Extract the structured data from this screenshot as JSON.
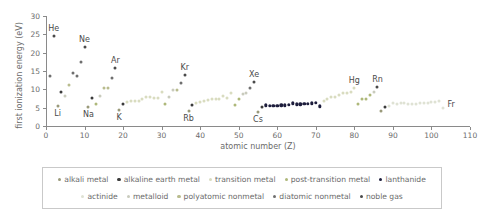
{
  "chart_data": {
    "type": "scatter",
    "title": "",
    "xlabel": "atomic number (Z)",
    "ylabel": "first ionization energy (eV)",
    "xlim": [
      0,
      110
    ],
    "ylim": [
      0,
      30
    ],
    "xticks": [
      0,
      10,
      20,
      30,
      40,
      50,
      60,
      70,
      80,
      90,
      100,
      110
    ],
    "yticks": [
      0,
      5,
      10,
      15,
      20,
      25,
      30
    ],
    "grid": false,
    "legend_position": "below-axes",
    "annotations": [
      {
        "label": "He",
        "x": 2,
        "y": 24.6
      },
      {
        "label": "Li",
        "x": 3,
        "y": 5.4
      },
      {
        "label": "Ne",
        "x": 10,
        "y": 21.6
      },
      {
        "label": "Na",
        "x": 11,
        "y": 5.1
      },
      {
        "label": "Ar",
        "x": 18,
        "y": 15.8
      },
      {
        "label": "K",
        "x": 19,
        "y": 4.3
      },
      {
        "label": "Kr",
        "x": 36,
        "y": 14.0
      },
      {
        "label": "Rb",
        "x": 37,
        "y": 4.2
      },
      {
        "label": "Xe",
        "x": 54,
        "y": 12.1
      },
      {
        "label": "Cs",
        "x": 55,
        "y": 3.9
      },
      {
        "label": "Hg",
        "x": 80,
        "y": 10.4
      },
      {
        "label": "Rn",
        "x": 86,
        "y": 10.7
      },
      {
        "label": "Fr",
        "x": 87,
        "y": 4.1
      }
    ],
    "categories": [
      {
        "key": "alkali",
        "label": "alkali metal",
        "color": "#9a9a7a"
      },
      {
        "key": "alkaline",
        "label": "alkaline earth metal",
        "color": "#3b3b3b"
      },
      {
        "key": "transition",
        "label": "transition metal",
        "color": "#d9dcc0"
      },
      {
        "key": "post_transition",
        "label": "post-transition metal",
        "color": "#aeb87a"
      },
      {
        "key": "lanthanide",
        "label": "lanthanide",
        "color": "#1d1d3c"
      },
      {
        "key": "actinide",
        "label": "actinide",
        "color": "#dfe2d4"
      },
      {
        "key": "metalloid",
        "label": "metalloid",
        "color": "#c9cbbd"
      },
      {
        "key": "polyatomic",
        "label": "polyatomic nonmetal",
        "color": "#b9bc8e"
      },
      {
        "key": "diatomic",
        "label": "diatomic nonmetal",
        "color": "#6f6f6f"
      },
      {
        "key": "noble",
        "label": "noble gas",
        "color": "#4a4a4a"
      }
    ],
    "points": [
      {
        "z": 1,
        "e": 13.6,
        "c": "diatomic"
      },
      {
        "z": 2,
        "e": 24.6,
        "c": "noble"
      },
      {
        "z": 3,
        "e": 5.4,
        "c": "alkali"
      },
      {
        "z": 4,
        "e": 9.3,
        "c": "alkaline"
      },
      {
        "z": 5,
        "e": 8.3,
        "c": "metalloid"
      },
      {
        "z": 6,
        "e": 11.3,
        "c": "polyatomic"
      },
      {
        "z": 7,
        "e": 14.5,
        "c": "diatomic"
      },
      {
        "z": 8,
        "e": 13.6,
        "c": "diatomic"
      },
      {
        "z": 9,
        "e": 17.4,
        "c": "diatomic"
      },
      {
        "z": 10,
        "e": 21.6,
        "c": "noble"
      },
      {
        "z": 11,
        "e": 5.1,
        "c": "alkali"
      },
      {
        "z": 12,
        "e": 7.6,
        "c": "alkaline"
      },
      {
        "z": 13,
        "e": 6.0,
        "c": "post_transition"
      },
      {
        "z": 14,
        "e": 8.2,
        "c": "metalloid"
      },
      {
        "z": 15,
        "e": 10.5,
        "c": "polyatomic"
      },
      {
        "z": 16,
        "e": 10.4,
        "c": "polyatomic"
      },
      {
        "z": 17,
        "e": 13.0,
        "c": "diatomic"
      },
      {
        "z": 18,
        "e": 15.8,
        "c": "noble"
      },
      {
        "z": 19,
        "e": 4.3,
        "c": "alkali"
      },
      {
        "z": 20,
        "e": 6.1,
        "c": "alkaline"
      },
      {
        "z": 21,
        "e": 6.6,
        "c": "transition"
      },
      {
        "z": 22,
        "e": 6.8,
        "c": "transition"
      },
      {
        "z": 23,
        "e": 6.7,
        "c": "transition"
      },
      {
        "z": 24,
        "e": 6.8,
        "c": "transition"
      },
      {
        "z": 25,
        "e": 7.4,
        "c": "transition"
      },
      {
        "z": 26,
        "e": 7.9,
        "c": "transition"
      },
      {
        "z": 27,
        "e": 7.9,
        "c": "transition"
      },
      {
        "z": 28,
        "e": 7.6,
        "c": "transition"
      },
      {
        "z": 29,
        "e": 7.7,
        "c": "transition"
      },
      {
        "z": 30,
        "e": 9.4,
        "c": "transition"
      },
      {
        "z": 31,
        "e": 6.0,
        "c": "post_transition"
      },
      {
        "z": 32,
        "e": 7.9,
        "c": "metalloid"
      },
      {
        "z": 33,
        "e": 9.8,
        "c": "metalloid"
      },
      {
        "z": 34,
        "e": 9.8,
        "c": "polyatomic"
      },
      {
        "z": 35,
        "e": 11.8,
        "c": "diatomic"
      },
      {
        "z": 36,
        "e": 14.0,
        "c": "noble"
      },
      {
        "z": 37,
        "e": 4.2,
        "c": "alkali"
      },
      {
        "z": 38,
        "e": 5.7,
        "c": "alkaline"
      },
      {
        "z": 39,
        "e": 6.2,
        "c": "transition"
      },
      {
        "z": 40,
        "e": 6.6,
        "c": "transition"
      },
      {
        "z": 41,
        "e": 6.8,
        "c": "transition"
      },
      {
        "z": 42,
        "e": 7.1,
        "c": "transition"
      },
      {
        "z": 43,
        "e": 7.3,
        "c": "transition"
      },
      {
        "z": 44,
        "e": 7.4,
        "c": "transition"
      },
      {
        "z": 45,
        "e": 7.5,
        "c": "transition"
      },
      {
        "z": 46,
        "e": 8.3,
        "c": "transition"
      },
      {
        "z": 47,
        "e": 7.6,
        "c": "transition"
      },
      {
        "z": 48,
        "e": 9.0,
        "c": "transition"
      },
      {
        "z": 49,
        "e": 5.8,
        "c": "post_transition"
      },
      {
        "z": 50,
        "e": 7.3,
        "c": "post_transition"
      },
      {
        "z": 51,
        "e": 8.6,
        "c": "metalloid"
      },
      {
        "z": 52,
        "e": 9.0,
        "c": "metalloid"
      },
      {
        "z": 53,
        "e": 10.5,
        "c": "diatomic"
      },
      {
        "z": 54,
        "e": 12.1,
        "c": "noble"
      },
      {
        "z": 55,
        "e": 3.9,
        "c": "alkali"
      },
      {
        "z": 56,
        "e": 5.2,
        "c": "alkaline"
      },
      {
        "z": 57,
        "e": 5.6,
        "c": "lanthanide"
      },
      {
        "z": 58,
        "e": 5.5,
        "c": "lanthanide"
      },
      {
        "z": 59,
        "e": 5.5,
        "c": "lanthanide"
      },
      {
        "z": 60,
        "e": 5.5,
        "c": "lanthanide"
      },
      {
        "z": 61,
        "e": 5.6,
        "c": "lanthanide"
      },
      {
        "z": 62,
        "e": 5.6,
        "c": "lanthanide"
      },
      {
        "z": 63,
        "e": 5.7,
        "c": "lanthanide"
      },
      {
        "z": 64,
        "e": 6.2,
        "c": "lanthanide"
      },
      {
        "z": 65,
        "e": 5.9,
        "c": "lanthanide"
      },
      {
        "z": 66,
        "e": 5.9,
        "c": "lanthanide"
      },
      {
        "z": 67,
        "e": 6.0,
        "c": "lanthanide"
      },
      {
        "z": 68,
        "e": 6.1,
        "c": "lanthanide"
      },
      {
        "z": 69,
        "e": 6.2,
        "c": "lanthanide"
      },
      {
        "z": 70,
        "e": 6.3,
        "c": "lanthanide"
      },
      {
        "z": 71,
        "e": 5.4,
        "c": "lanthanide"
      },
      {
        "z": 72,
        "e": 6.8,
        "c": "transition"
      },
      {
        "z": 73,
        "e": 7.5,
        "c": "transition"
      },
      {
        "z": 74,
        "e": 7.9,
        "c": "transition"
      },
      {
        "z": 75,
        "e": 7.8,
        "c": "transition"
      },
      {
        "z": 76,
        "e": 8.4,
        "c": "transition"
      },
      {
        "z": 77,
        "e": 8.9,
        "c": "transition"
      },
      {
        "z": 78,
        "e": 9.0,
        "c": "transition"
      },
      {
        "z": 79,
        "e": 9.2,
        "c": "transition"
      },
      {
        "z": 80,
        "e": 10.4,
        "c": "transition"
      },
      {
        "z": 81,
        "e": 6.1,
        "c": "post_transition"
      },
      {
        "z": 82,
        "e": 7.4,
        "c": "post_transition"
      },
      {
        "z": 83,
        "e": 7.3,
        "c": "post_transition"
      },
      {
        "z": 84,
        "e": 8.4,
        "c": "post_transition"
      },
      {
        "z": 85,
        "e": 9.3,
        "c": "metalloid"
      },
      {
        "z": 86,
        "e": 10.7,
        "c": "noble"
      },
      {
        "z": 87,
        "e": 4.1,
        "c": "alkali"
      },
      {
        "z": 88,
        "e": 5.3,
        "c": "alkaline"
      },
      {
        "z": 89,
        "e": 5.4,
        "c": "actinide"
      },
      {
        "z": 90,
        "e": 6.3,
        "c": "actinide"
      },
      {
        "z": 91,
        "e": 5.9,
        "c": "actinide"
      },
      {
        "z": 92,
        "e": 6.2,
        "c": "actinide"
      },
      {
        "z": 93,
        "e": 6.3,
        "c": "actinide"
      },
      {
        "z": 94,
        "e": 6.0,
        "c": "actinide"
      },
      {
        "z": 95,
        "e": 6.0,
        "c": "actinide"
      },
      {
        "z": 96,
        "e": 6.0,
        "c": "actinide"
      },
      {
        "z": 97,
        "e": 6.2,
        "c": "actinide"
      },
      {
        "z": 98,
        "e": 6.3,
        "c": "actinide"
      },
      {
        "z": 99,
        "e": 6.4,
        "c": "actinide"
      },
      {
        "z": 100,
        "e": 6.5,
        "c": "actinide"
      },
      {
        "z": 101,
        "e": 6.6,
        "c": "actinide"
      },
      {
        "z": 102,
        "e": 6.7,
        "c": "actinide"
      },
      {
        "z": 103,
        "e": 4.9,
        "c": "actinide"
      }
    ]
  }
}
